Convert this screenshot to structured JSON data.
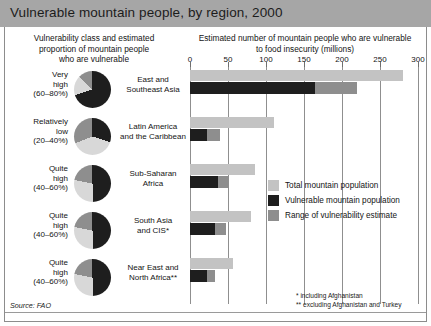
{
  "title": "Vulnerable mountain people, by region, 2000",
  "headers": {
    "left": "Vulnerability class and estimated proportion of mountain people who are vulnerable",
    "left_line1": "Vulnerability class and estimated",
    "left_line2": "proportion of mountain people",
    "left_line3": "who are vulnerable",
    "right_line1": "Estimated number of mountain people who are vulnerable",
    "right_line2": "to food insecurity (millions)"
  },
  "source": "Source: FAO",
  "footnotes": {
    "one": "* including Afghanistan",
    "two": "** excluding Afghanistan and Turkey"
  },
  "legend": [
    {
      "label": "Total mountain population",
      "color": "#c3c3c3"
    },
    {
      "label": "Vulnerable mountain population",
      "color": "#1e1e1e"
    },
    {
      "label": "Range of vulnerability estimate",
      "color": "#8e8e8e"
    }
  ],
  "rows": [
    {
      "vclass_line1": "Very",
      "vclass_line2": "high",
      "vclass_line3": "(60–80%)",
      "region_line1": "East and",
      "region_line2": "Southeast Asia",
      "pie_dark_pct": 70
    },
    {
      "vclass_line1": "Relatively",
      "vclass_line2": "low",
      "vclass_line3": "(20–40%)",
      "region_line1": "Latin America",
      "region_line2": "and the Caribbean",
      "pie_dark_pct": 30
    },
    {
      "vclass_line1": "Quite",
      "vclass_line2": "high",
      "vclass_line3": "(40–60%)",
      "region_line1": "Sub-Saharan",
      "region_line2": "Africa",
      "pie_dark_pct": 50
    },
    {
      "vclass_line1": "Quite",
      "vclass_line2": "high",
      "vclass_line3": "(40–60%)",
      "region_line1": "South Asia",
      "region_line2": "and CIS*",
      "pie_dark_pct": 50
    },
    {
      "vclass_line1": "Quite",
      "vclass_line2": "high",
      "vclass_line3": "(40–60%)",
      "region_line1": "Near East and",
      "region_line2": "North Africa**",
      "pie_dark_pct": 50
    }
  ],
  "chart_data": {
    "type": "bar",
    "title": "Vulnerable mountain people, by region, 2000",
    "xlabel": "Estimated number of mountain people who are vulnerable to food insecurity (millions)",
    "ylabel": "",
    "xlim": [
      0,
      300
    ],
    "xticks": [
      0,
      50,
      100,
      150,
      200,
      250,
      300
    ],
    "grid": true,
    "orientation": "horizontal",
    "legend_position": "right-middle",
    "categories": [
      "East and Southeast Asia",
      "Latin America and the Caribbean",
      "Sub-Saharan Africa",
      "South Asia and CIS*",
      "Near East and North Africa**"
    ],
    "series": [
      {
        "name": "Total mountain population",
        "color": "#c3c3c3",
        "values": [
          280,
          110,
          85,
          80,
          57
        ]
      },
      {
        "name": "Vulnerable mountain population",
        "color": "#1e1e1e",
        "values": [
          165,
          22,
          37,
          33,
          23
        ]
      },
      {
        "name": "Range of vulnerability estimate",
        "color": "#8e8e8e",
        "values": [
          220,
          40,
          50,
          48,
          33
        ]
      }
    ],
    "vulnerability_class": [
      {
        "label": "Very high",
        "range": "60–80%"
      },
      {
        "label": "Relatively low",
        "range": "20–40%"
      },
      {
        "label": "Quite high",
        "range": "40–60%"
      },
      {
        "label": "Quite high",
        "range": "40–60%"
      },
      {
        "label": "Quite high",
        "range": "40–60%"
      }
    ]
  }
}
